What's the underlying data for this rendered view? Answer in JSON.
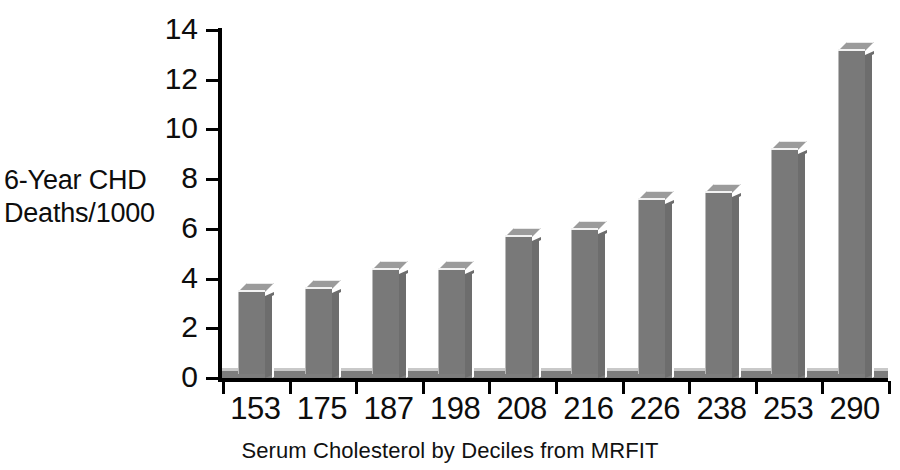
{
  "chart_data": {
    "type": "bar",
    "title": "",
    "xlabel": "Serum Cholesterol by Deciles from MRFIT",
    "ylabel": "6-Year CHD\nDeaths/1000",
    "categories": [
      "153",
      "175",
      "187",
      "198",
      "208",
      "216",
      "226",
      "238",
      "253",
      "290"
    ],
    "values": [
      3.3,
      3.4,
      4.2,
      4.2,
      5.5,
      5.8,
      7.0,
      7.3,
      9.0,
      13.0
    ],
    "series": [
      {
        "name": "6-Year CHD Deaths/1000",
        "values": [
          3.3,
          3.4,
          4.2,
          4.2,
          5.5,
          5.8,
          7.0,
          7.3,
          9.0,
          13.0
        ]
      }
    ],
    "ylim": [
      0,
      14
    ],
    "ytick_labels": [
      "0",
      "2",
      "4",
      "6",
      "8",
      "10",
      "12",
      "14"
    ],
    "ytick_values": [
      0,
      2,
      4,
      6,
      8,
      10,
      12,
      14
    ],
    "grid": false,
    "legend": "none",
    "style": "3d-bars",
    "colors": {
      "bar_face": "#797979",
      "bar_side": "#6d6d6d",
      "bar_top": "#9b9b9b",
      "axis": "#000000",
      "text": "#0d0d0d",
      "background": "#ffffff"
    }
  }
}
